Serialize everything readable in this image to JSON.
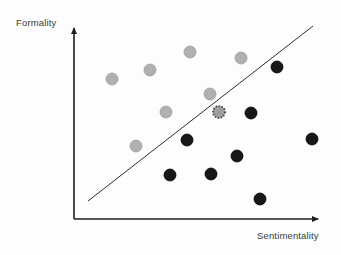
{
  "figure": {
    "title": "",
    "background_color": "#fdfdfd"
  },
  "axes": {
    "y_label": "Formality",
    "x_label": "Sentimentality",
    "axis_color": "#1f1f1f",
    "origin": {
      "x": 74,
      "y": 219
    },
    "x_axis_end": {
      "x": 325,
      "y": 219
    },
    "y_axis_end": {
      "x": 74,
      "y": 21
    }
  },
  "decision_boundary": {
    "name": "separating-line",
    "color": "#2e2e2e",
    "width": 1,
    "start": {
      "x": 88,
      "y": 201
    },
    "end": {
      "x": 313,
      "y": 26
    }
  },
  "legend": {
    "visible": false,
    "entries": []
  },
  "chart_data": {
    "type": "scatter",
    "title": "",
    "xlabel": "Sentimentality",
    "ylabel": "Formality",
    "xlim": [
      0,
      1
    ],
    "ylim": [
      0,
      1
    ],
    "grid": false,
    "axis_ticks": false,
    "legend_position": "none",
    "annotations": [
      {
        "name": "separating-line",
        "type": "line",
        "from": [
          0.056,
          0.091
        ],
        "to": [
          0.952,
          0.974
        ]
      }
    ],
    "series": [
      {
        "name": "gray-class",
        "marker": "filled-circle",
        "color": "#b0b0b0",
        "edge_color": "#9c9c9c",
        "radius": 6,
        "points": [
          {
            "px": 112,
            "py": 79,
            "x": 0.151,
            "y": 0.707
          },
          {
            "px": 150,
            "py": 70,
            "x": 0.303,
            "y": 0.753
          },
          {
            "px": 190,
            "py": 52,
            "x": 0.462,
            "y": 0.843
          },
          {
            "px": 241,
            "py": 58,
            "x": 0.665,
            "y": 0.813
          },
          {
            "px": 210,
            "py": 94,
            "x": 0.542,
            "y": 0.631
          },
          {
            "px": 166,
            "py": 112,
            "x": 0.366,
            "y": 0.54
          },
          {
            "px": 136,
            "py": 146,
            "x": 0.247,
            "y": 0.369
          }
        ]
      },
      {
        "name": "black-class",
        "marker": "filled-circle",
        "color": "#171717",
        "edge_color": "#000000",
        "radius": 6,
        "points": [
          {
            "px": 277,
            "py": 67,
            "x": 0.809,
            "y": 0.768
          },
          {
            "px": 251,
            "py": 113,
            "x": 0.705,
            "y": 0.535
          },
          {
            "px": 187,
            "py": 140,
            "x": 0.45,
            "y": 0.399
          },
          {
            "px": 312,
            "py": 139,
            "x": 0.948,
            "y": 0.404
          },
          {
            "px": 237,
            "py": 156,
            "x": 0.649,
            "y": 0.318
          },
          {
            "px": 170,
            "py": 175,
            "x": 0.382,
            "y": 0.222
          },
          {
            "px": 211,
            "py": 174,
            "x": 0.546,
            "y": 0.227
          },
          {
            "px": 260,
            "py": 199,
            "x": 0.741,
            "y": 0.101
          }
        ]
      },
      {
        "name": "highlighted-point",
        "marker": "dashed-outline-circle",
        "color": "#9e9e9e",
        "edge_color": "#3a3a3a",
        "radius": 6,
        "points": [
          {
            "px": 219,
            "py": 112,
            "x": 0.578,
            "y": 0.54
          }
        ]
      }
    ]
  }
}
